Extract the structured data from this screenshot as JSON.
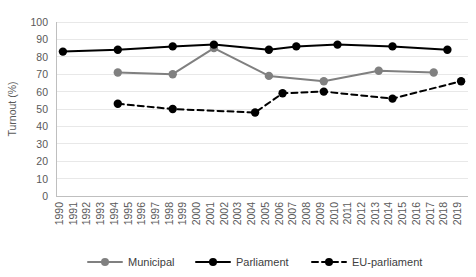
{
  "chart_data": {
    "type": "line",
    "title": "",
    "xlabel": "",
    "ylabel": "Turnout (%)",
    "ylim": [
      0,
      100
    ],
    "ytick_step": 10,
    "yticks": [
      0,
      10,
      20,
      30,
      40,
      50,
      60,
      70,
      80,
      90,
      100
    ],
    "grid": true,
    "legend_position": "bottom",
    "x": [
      1990,
      1991,
      1992,
      1993,
      1994,
      1995,
      1996,
      1997,
      1998,
      1999,
      2000,
      2001,
      2002,
      2003,
      2004,
      2005,
      2006,
      2007,
      2008,
      2009,
      2010,
      2011,
      2012,
      2013,
      2014,
      2015,
      2016,
      2017,
      2018,
      2019
    ],
    "categories": [
      "1990",
      "1991",
      "1992",
      "1993",
      "1994",
      "1995",
      "1996",
      "1997",
      "1998",
      "1999",
      "2000",
      "2001",
      "2002",
      "2003",
      "2004",
      "2005",
      "2006",
      "2007",
      "2008",
      "2009",
      "2010",
      "2011",
      "2012",
      "2013",
      "2014",
      "2015",
      "2016",
      "2017",
      "2018",
      "2019"
    ],
    "series": [
      {
        "name": "Municipal",
        "color": "#808080",
        "dash": "solid",
        "points": [
          {
            "x": 1994,
            "y": 71
          },
          {
            "x": 1998,
            "y": 70
          },
          {
            "x": 2001,
            "y": 85
          },
          {
            "x": 2005,
            "y": 69
          },
          {
            "x": 2009,
            "y": 66
          },
          {
            "x": 2013,
            "y": 72
          },
          {
            "x": 2017,
            "y": 71
          }
        ]
      },
      {
        "name": "Parliament",
        "color": "#000000",
        "dash": "solid",
        "points": [
          {
            "x": 1990,
            "y": 83
          },
          {
            "x": 1994,
            "y": 84
          },
          {
            "x": 1998,
            "y": 86
          },
          {
            "x": 2001,
            "y": 87
          },
          {
            "x": 2005,
            "y": 84
          },
          {
            "x": 2007,
            "y": 86
          },
          {
            "x": 2010,
            "y": 87
          },
          {
            "x": 2014,
            "y": 86
          },
          {
            "x": 2018,
            "y": 84
          }
        ]
      },
      {
        "name": "EU-parliament",
        "color": "#000000",
        "dash": "dashed",
        "points": [
          {
            "x": 1994,
            "y": 53
          },
          {
            "x": 1998,
            "y": 50
          },
          {
            "x": 2004,
            "y": 48
          },
          {
            "x": 2006,
            "y": 59
          },
          {
            "x": 2009,
            "y": 60
          },
          {
            "x": 2014,
            "y": 56
          },
          {
            "x": 2019,
            "y": 66
          }
        ]
      }
    ]
  },
  "legend": {
    "items": [
      {
        "label": "Municipal"
      },
      {
        "label": "Parliament"
      },
      {
        "label": "EU-parliament"
      }
    ]
  }
}
